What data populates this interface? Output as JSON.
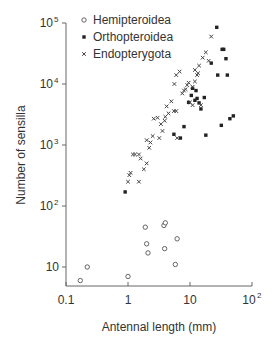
{
  "chart_data": {
    "type": "scatter",
    "title": "",
    "xlabel": "Antennal length (mm)",
    "ylabel": "Number of sensilla",
    "xscale": "log",
    "yscale": "log",
    "xlim": [
      0.1,
      100
    ],
    "ylim": [
      5,
      100000
    ],
    "x_ticks": [
      {
        "value": 0.1,
        "label": "0.1"
      },
      {
        "value": 1,
        "label": "1"
      },
      {
        "value": 10,
        "label": "10"
      },
      {
        "value": 100,
        "label": "10",
        "sup": "2"
      }
    ],
    "y_ticks": [
      {
        "value": 10,
        "label": "10",
        "sup": ""
      },
      {
        "value": 100,
        "label": "10",
        "sup": "2"
      },
      {
        "value": 1000,
        "label": "10",
        "sup": "3"
      },
      {
        "value": 10000,
        "label": "10",
        "sup": "4"
      },
      {
        "value": 100000,
        "label": "10",
        "sup": "5"
      }
    ],
    "grid": false,
    "legend_position": "top-left",
    "series": [
      {
        "name": "Hemipteroidea",
        "marker": "open-circle",
        "points": [
          [
            0.17,
            6
          ],
          [
            0.22,
            10
          ],
          [
            1.0,
            7
          ],
          [
            1.9,
            45
          ],
          [
            2.0,
            24
          ],
          [
            2.1,
            17
          ],
          [
            3.8,
            48
          ],
          [
            4.0,
            53
          ],
          [
            3.9,
            20
          ],
          [
            6.2,
            29
          ],
          [
            5.8,
            11
          ]
        ]
      },
      {
        "name": "Orthopteroidea",
        "marker": "filled-square",
        "points": [
          [
            0.9,
            170
          ],
          [
            5.5,
            1500
          ],
          [
            7.0,
            1300
          ],
          [
            8.0,
            2000
          ],
          [
            10.5,
            6500
          ],
          [
            9.5,
            5000
          ],
          [
            12,
            5400
          ],
          [
            13,
            5800
          ],
          [
            14,
            4900
          ],
          [
            15,
            3900
          ],
          [
            11,
            8500
          ],
          [
            12.5,
            7800
          ],
          [
            17,
            6000
          ],
          [
            18,
            1450
          ],
          [
            22,
            22000
          ],
          [
            28,
            14000
          ],
          [
            33,
            37000
          ],
          [
            35,
            37000
          ],
          [
            38,
            26000
          ],
          [
            32,
            2100
          ],
          [
            44,
            2700
          ],
          [
            50,
            3000
          ],
          [
            40,
            14000
          ],
          [
            27,
            85000
          ]
        ]
      },
      {
        "name": "Endopterygota",
        "marker": "x-cross",
        "points": [
          [
            1.0,
            250
          ],
          [
            1.05,
            320
          ],
          [
            1.1,
            350
          ],
          [
            1.2,
            700
          ],
          [
            1.3,
            700
          ],
          [
            1.5,
            700
          ],
          [
            1.5,
            250
          ],
          [
            1.6,
            600
          ],
          [
            1.8,
            400
          ],
          [
            2.0,
            500
          ],
          [
            2.2,
            900
          ],
          [
            2.3,
            1100
          ],
          [
            2.5,
            1400
          ],
          [
            2.6,
            2700
          ],
          [
            3.0,
            2800
          ],
          [
            3.2,
            1300
          ],
          [
            3.4,
            2200
          ],
          [
            3.6,
            1700
          ],
          [
            3.9,
            2500
          ],
          [
            4.2,
            4300
          ],
          [
            4.5,
            3300
          ],
          [
            5.0,
            5200
          ],
          [
            5.5,
            3600
          ],
          [
            6.0,
            3600
          ],
          [
            5.6,
            10000
          ],
          [
            6.0,
            14000
          ],
          [
            6.8,
            16000
          ],
          [
            7.5,
            7000
          ],
          [
            8.0,
            7800
          ],
          [
            9.0,
            9600
          ],
          [
            9.5,
            10500
          ],
          [
            10,
            5000
          ],
          [
            11,
            4500
          ],
          [
            11,
            9000
          ],
          [
            12,
            17000
          ],
          [
            13,
            14000
          ],
          [
            14,
            20000
          ],
          [
            16,
            27000
          ],
          [
            18,
            33000
          ],
          [
            22,
            60000
          ],
          [
            6.2,
            1300
          ],
          [
            4.0,
            2900
          ],
          [
            2.0,
            1200
          ],
          [
            15,
            4500
          ],
          [
            20,
            24000
          ],
          [
            8.5,
            8200
          ],
          [
            12,
            11000
          ],
          [
            13.5,
            15000
          ]
        ]
      }
    ]
  },
  "legend": {
    "items": [
      {
        "label": "Hemipteroidea",
        "marker": "open-circle"
      },
      {
        "label": "Orthopteroidea",
        "marker": "filled-square"
      },
      {
        "label": "Endopterygota",
        "marker": "x-cross"
      }
    ]
  },
  "colors": {
    "axis": "#666666",
    "text": "#333333",
    "marker": "#222222"
  }
}
